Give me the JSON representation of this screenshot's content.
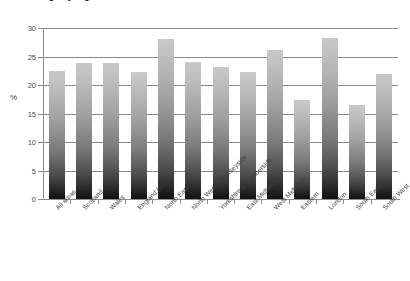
{
  "chart_data": {
    "type": "bar",
    "title": "Percentage by region",
    "xlabel": "",
    "ylabel": "%",
    "ylim": [
      0,
      30
    ],
    "yticks": [
      0,
      5,
      10,
      15,
      20,
      25,
      30
    ],
    "ytick_labels": [
      "0",
      "5",
      "10",
      "15",
      "20",
      "25",
      "30"
    ],
    "grid": true,
    "legend": "none",
    "categories": [
      "All areas",
      "Scotland",
      "Wales",
      "England (all)",
      "North East",
      "North West & Merseyside",
      "Yorkshire & Humberside",
      "East Midlands",
      "West Midlands",
      "Eastern",
      "London",
      "South East",
      "South West"
    ],
    "values": [
      22.5,
      23.8,
      23.8,
      22.2,
      28.0,
      24.0,
      23.2,
      22.3,
      26.2,
      17.3,
      28.3,
      16.5,
      22.0
    ],
    "series": [
      {
        "name": "Percentage",
        "values": [
          22.5,
          23.8,
          23.8,
          22.2,
          28.0,
          24.0,
          23.2,
          22.3,
          26.2,
          17.3,
          28.3,
          16.5,
          22.0
        ]
      }
    ]
  },
  "colors": {
    "bar_top": "#c9c9c9",
    "bar_bottom": "#111111",
    "gridline": "#8a8a8a",
    "axis": "#8f8f8f",
    "text": "#3d3d3d",
    "background": "#ffffff"
  }
}
